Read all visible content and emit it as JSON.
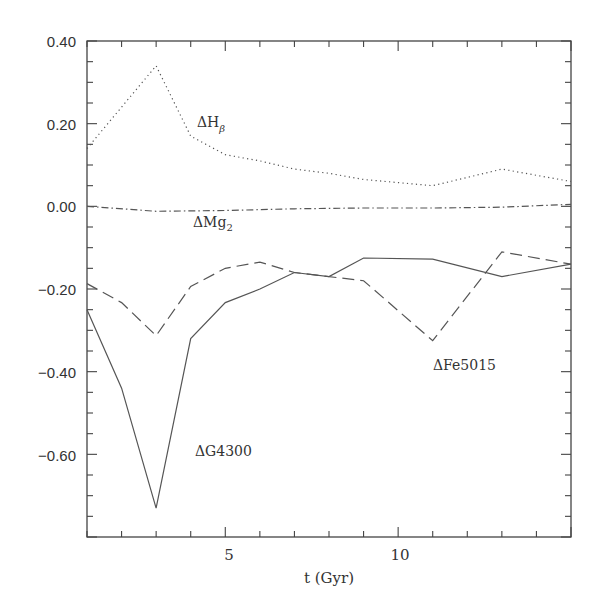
{
  "chart_data": {
    "type": "line",
    "title": "",
    "xlabel": "t (Gyr)",
    "ylabel": "",
    "xlim": [
      1,
      15
    ],
    "ylim": [
      -0.8,
      0.4
    ],
    "grid": false,
    "legend": "none (inline annotations)",
    "x_ticks": [
      5,
      10
    ],
    "x_tick_labels": [
      "5",
      "10"
    ],
    "y_ticks": [
      0.4,
      0.2,
      0.0,
      -0.2,
      -0.4,
      -0.6
    ],
    "y_tick_labels": [
      "0.40",
      "0.20",
      "0.00",
      "-0.20",
      "-0.40",
      "-0.60"
    ],
    "x": [
      1,
      2,
      3,
      4,
      5,
      6,
      7,
      8,
      9,
      10,
      11,
      12,
      13,
      14,
      15
    ],
    "series": [
      {
        "name": "ΔHβ",
        "style": "dotted",
        "x": [
          1,
          3,
          4,
          5,
          6,
          7,
          8,
          9,
          11,
          13,
          15
        ],
        "values": [
          0.14,
          0.34,
          0.17,
          0.125,
          0.11,
          0.09,
          0.08,
          0.065,
          0.05,
          0.09,
          0.06
        ]
      },
      {
        "name": "ΔMg2",
        "style": "dash-dot",
        "x": [
          1,
          3,
          5,
          7,
          9,
          11,
          13,
          15
        ],
        "values": [
          0.0,
          -0.012,
          -0.01,
          -0.006,
          -0.004,
          -0.004,
          -0.002,
          0.005
        ]
      },
      {
        "name": "ΔFe5015",
        "style": "dashed",
        "x": [
          1,
          2,
          3,
          4,
          5,
          6,
          7,
          9,
          11,
          13,
          15
        ],
        "values": [
          -0.187,
          -0.233,
          -0.313,
          -0.194,
          -0.15,
          -0.135,
          -0.16,
          -0.18,
          -0.325,
          -0.11,
          -0.14
        ]
      },
      {
        "name": "ΔG4300",
        "style": "solid",
        "x": [
          1,
          2,
          3,
          4,
          5,
          6,
          7,
          8,
          9,
          11,
          13,
          15
        ],
        "values": [
          -0.25,
          -0.44,
          -0.73,
          -0.32,
          -0.233,
          -0.2,
          -0.16,
          -0.17,
          -0.125,
          -0.128,
          -0.17,
          -0.14
        ]
      }
    ],
    "annotations": [
      {
        "text": "ΔHβ",
        "x": 5.0,
        "y": 0.22
      },
      {
        "text": "ΔMg2",
        "x": 5.0,
        "y": -0.06
      },
      {
        "text": "ΔFe5015",
        "x": 11.3,
        "y": -0.43
      },
      {
        "text": "ΔG4300",
        "x": 5.0,
        "y": -0.62
      }
    ]
  },
  "labels": {
    "y_ticks": [
      "0.40",
      "0.20",
      "0.00",
      "−0.20",
      "−0.40",
      "−0.60"
    ],
    "x_ticks": [
      "5",
      "10"
    ],
    "xlabel": "t (Gyr)",
    "anno_hbeta_main": "ΔH",
    "anno_hbeta_sub": "β",
    "anno_mg_main": "ΔMg",
    "anno_mg_sub": "2",
    "anno_fe": "ΔFe5015",
    "anno_g": "ΔG4300"
  },
  "colors": {
    "axis": "#444444",
    "line": "#555555",
    "background": "#ffffff"
  }
}
